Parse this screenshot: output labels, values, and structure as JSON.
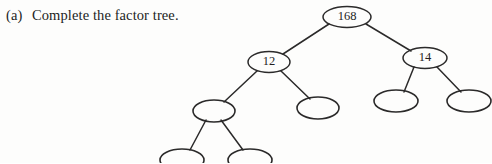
{
  "page": {
    "background_color": "#fdfdfc",
    "ink_color": "#2b2a2a",
    "width": 492,
    "height": 163
  },
  "question": {
    "label": "(a)",
    "text": "Complete the factor tree."
  },
  "diagram": {
    "kind": "factor-tree",
    "nodes": [
      {
        "id": "root",
        "value": "168",
        "filled": true,
        "cx": 347,
        "cy": 17,
        "rx": 24,
        "ry": 10.5
      },
      {
        "id": "l1-left",
        "value": "12",
        "filled": true,
        "cx": 269,
        "cy": 62,
        "rx": 21,
        "ry": 10.5
      },
      {
        "id": "l1-right",
        "value": "14",
        "filled": true,
        "cx": 425,
        "cy": 58,
        "rx": 22,
        "ry": 10.5
      },
      {
        "id": "l2-a",
        "value": "",
        "filled": false,
        "cx": 214,
        "cy": 111,
        "rx": 21,
        "ry": 11
      },
      {
        "id": "l2-b",
        "value": "",
        "filled": false,
        "cx": 318,
        "cy": 108,
        "rx": 21,
        "ry": 11
      },
      {
        "id": "l2-c",
        "value": "",
        "filled": false,
        "cx": 396,
        "cy": 101,
        "rx": 22,
        "ry": 11
      },
      {
        "id": "l2-d",
        "value": "",
        "filled": false,
        "cx": 469,
        "cy": 101,
        "rx": 22,
        "ry": 11
      },
      {
        "id": "l3-a",
        "value": "",
        "filled": false,
        "cx": 182,
        "cy": 160,
        "rx": 22,
        "ry": 11
      },
      {
        "id": "l3-b",
        "value": "",
        "filled": false,
        "cx": 250,
        "cy": 160,
        "rx": 22,
        "ry": 11
      }
    ],
    "edges": [
      {
        "from": "root",
        "to": "l1-left",
        "x1": 329,
        "y1": 24,
        "x2": 283,
        "y2": 54
      },
      {
        "from": "root",
        "to": "l1-right",
        "x1": 366,
        "y1": 24,
        "x2": 411,
        "y2": 51
      },
      {
        "from": "l1-left",
        "to": "l2-a",
        "x1": 257,
        "y1": 71,
        "x2": 224,
        "y2": 102
      },
      {
        "from": "l1-left",
        "to": "l2-b",
        "x1": 281,
        "y1": 71,
        "x2": 310,
        "y2": 99
      },
      {
        "from": "l1-right",
        "to": "l2-c",
        "x1": 414,
        "y1": 67,
        "x2": 404,
        "y2": 92
      },
      {
        "from": "l1-right",
        "to": "l2-d",
        "x1": 437,
        "y1": 67,
        "x2": 461,
        "y2": 92
      },
      {
        "from": "l2-a",
        "to": "l3-a",
        "x1": 206,
        "y1": 120,
        "x2": 190,
        "y2": 150
      },
      {
        "from": "l2-a",
        "to": "l3-b",
        "x1": 221,
        "y1": 120,
        "x2": 243,
        "y2": 150
      }
    ]
  }
}
